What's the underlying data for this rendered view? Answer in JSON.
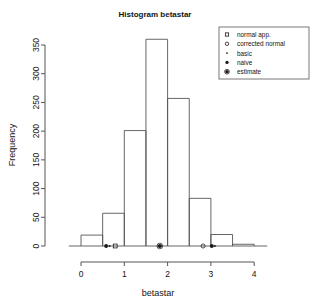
{
  "chart_data": {
    "type": "bar",
    "title": "Histogram betastar",
    "xlabel": "betastar",
    "ylabel": "Frequency",
    "grid": false,
    "bin_width": 0.5,
    "bin_edges": [
      0,
      0.5,
      1.0,
      1.5,
      2.0,
      2.5,
      3.0,
      3.5,
      4.0
    ],
    "categories": [
      "0-0.5",
      "0.5-1",
      "1-1.5",
      "1.5-2",
      "2-2.5",
      "2.5-3",
      "3-3.5",
      "3.5-4"
    ],
    "values": [
      19,
      57,
      201,
      360,
      257,
      83,
      20,
      3
    ],
    "xlim": [
      -0.28,
      4.3
    ],
    "ylim": [
      0,
      365
    ],
    "xticks": [
      "0",
      "1",
      "2",
      "3",
      "4"
    ],
    "xtick_values": [
      0,
      1,
      2,
      3,
      4
    ],
    "yticks": [
      "0",
      "50",
      "100",
      "150",
      "200",
      "250",
      "300",
      "350"
    ],
    "ytick_values": [
      0,
      50,
      100,
      150,
      200,
      250,
      300,
      350
    ],
    "legend_position": "top-right",
    "legend": [
      {
        "label": "normal app.",
        "symbol": "open-square"
      },
      {
        "label": "corrected normal",
        "symbol": "open-circle"
      },
      {
        "label": "basic",
        "symbol": "small-dot"
      },
      {
        "label": "naive",
        "symbol": "filled-circle"
      },
      {
        "label": "estimate",
        "symbol": "circled-dot"
      }
    ],
    "annotations": [
      {
        "label": "naive",
        "symbol": "filled-circle",
        "x": 0.58,
        "y": 0
      },
      {
        "label": "basic",
        "symbol": "small-dot",
        "x": 0.66,
        "y": 0
      },
      {
        "label": "normal app.",
        "symbol": "open-square",
        "x": 0.79,
        "y": 0
      },
      {
        "label": "estimate",
        "symbol": "circled-dot",
        "x": 1.82,
        "y": 0
      },
      {
        "label": "corrected normal",
        "symbol": "open-circle",
        "x": 2.82,
        "y": 0
      },
      {
        "label": "naive",
        "symbol": "filled-circle",
        "x": 3.02,
        "y": 0
      },
      {
        "label": "basic",
        "symbol": "small-dot",
        "x": 3.09,
        "y": 0
      }
    ],
    "colors": {
      "line": "#555555",
      "text": "#141414",
      "background": "#ffffff"
    }
  }
}
